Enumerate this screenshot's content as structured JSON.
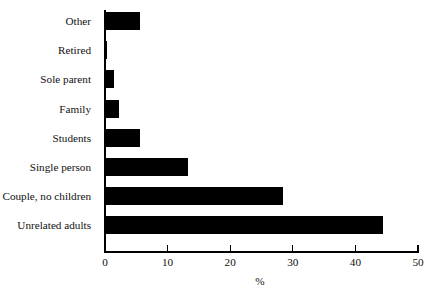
{
  "chart_data": {
    "type": "bar",
    "orientation": "horizontal",
    "title": "",
    "xlabel": "%",
    "ylabel": "",
    "categories": [
      "Other",
      "Retired",
      "Sole parent",
      "Family",
      "Students",
      "Single person",
      "Couple, no children",
      "Unrelated adults"
    ],
    "values": [
      5.6,
      0.3,
      1.4,
      2.2,
      5.6,
      13.3,
      28.4,
      44.4
    ],
    "xlim": [
      0,
      50
    ],
    "xticks": [
      0,
      10,
      20,
      30,
      40,
      50
    ],
    "xtick_labels": [
      "0",
      "10",
      "20",
      "30",
      "40",
      "50"
    ],
    "grid": false,
    "legend": null,
    "bar_color": "#000000",
    "background_color": "#ffffff",
    "axis_color": "#000000"
  }
}
